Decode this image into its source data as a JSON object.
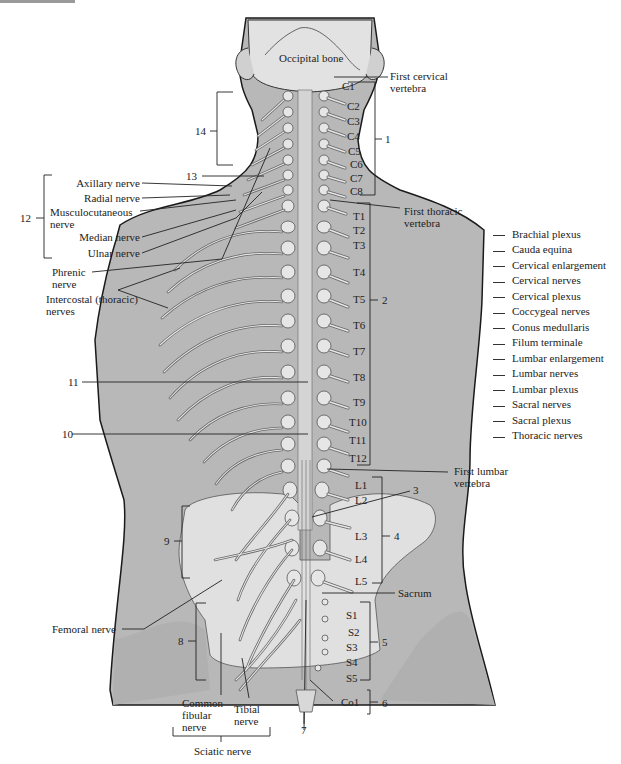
{
  "figure": {
    "bones": {
      "occipital_bone": "Occipital bone",
      "first_cervical_vertebra": [
        "First cervical",
        "vertebra"
      ],
      "first_thoracic_vertebra": [
        "First thoracic",
        "vertebra"
      ],
      "first_lumbar_vertebra": [
        "First lumbar",
        "vertebra"
      ],
      "sacrum": "Sacrum"
    },
    "vertebrae": {
      "cervical": [
        "C1",
        "C2",
        "C3",
        "C4",
        "C5",
        "C6",
        "C7",
        "C8"
      ],
      "thoracic": [
        "T1",
        "T2",
        "T3",
        "T4",
        "T5",
        "T6",
        "T7",
        "T8",
        "T9",
        "T10",
        "T11",
        "T12"
      ],
      "lumbar": [
        "L1",
        "L2",
        "L3",
        "L4",
        "L5"
      ],
      "sacral": [
        "S1",
        "S2",
        "S3",
        "S4",
        "S5"
      ],
      "coccygeal": [
        "Co1"
      ]
    },
    "named_nerves": {
      "axillary": "Axillary nerve",
      "radial": "Radial nerve",
      "musculocutaneous": [
        "Musculocutaneous",
        "nerve"
      ],
      "median": "Median nerve",
      "ulnar": "Ulnar nerve",
      "phrenic": [
        "Phrenic",
        "nerve"
      ],
      "intercostal": [
        "Intercostal (thoracic)",
        "nerves"
      ],
      "femoral": "Femoral nerve",
      "common_fibular": [
        "Common",
        "fibular",
        "nerve"
      ],
      "tibial": [
        "Tibial",
        "nerve"
      ],
      "sciatic": "Sciatic nerve"
    },
    "numbered_callouts": [
      "1",
      "2",
      "3",
      "4",
      "5",
      "6",
      "7",
      "8",
      "9",
      "10",
      "11",
      "12",
      "13",
      "14"
    ]
  },
  "legend": {
    "items": [
      "Brachial plexus",
      "Cauda equina",
      "Cervical enlargement",
      "Cervical nerves",
      "Cervical plexus",
      "Coccygeal nerves",
      "Conus medullaris",
      "Filum terminale",
      "Lumbar enlargement",
      "Lumbar nerves",
      "Lumbar plexus",
      "Sacral nerves",
      "Sacral plexus",
      "Thoracic nerves"
    ]
  },
  "colors": {
    "body_fill": "#b8b8b8",
    "bone_fill": "#e4e4e4",
    "outline": "#1a1a1a",
    "background": "#ffffff"
  }
}
